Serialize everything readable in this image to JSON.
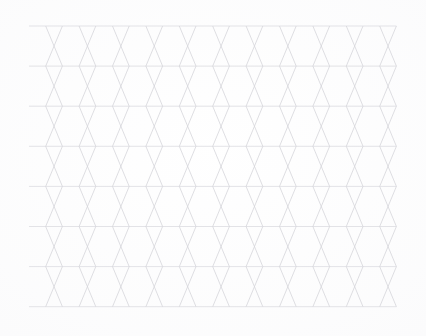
{
  "document": {
    "kind": "triangle-grid-paper",
    "title": "Isometric Triangle Grid Paper",
    "orientation": "landscape"
  },
  "canvas": {
    "width": 426,
    "height": 336,
    "background_color": "#fbfbfb",
    "paper_color": "#fdfdfd"
  },
  "grid": {
    "pattern": "equilateral-triangle-tiling",
    "left": 29,
    "top": 26,
    "right": 396,
    "bottom": 307,
    "width": 367,
    "height": 281,
    "columns": 11,
    "rows": 7,
    "cell_width": 33.4,
    "row_height": 40.1,
    "line_color": "#d9d9de",
    "line_color_horizontal": "#dcdce1",
    "line_color_diagonal": "#d5d5db",
    "line_width": 0.8,
    "horizontal_line_count": 8,
    "triangles_per_row": 22,
    "total_triangles": 154
  },
  "legend": {
    "note": "No text, labels, or UI controls are present in the image."
  }
}
